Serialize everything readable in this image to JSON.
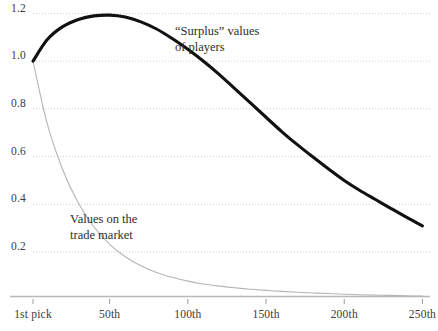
{
  "chart_data": {
    "type": "line",
    "title": "",
    "xlabel": "",
    "ylabel": "",
    "grid": true,
    "legend_position": "inline-annotations",
    "xlim": [
      1,
      256
    ],
    "ylim": [
      0,
      1.26
    ],
    "x_tick_labels": [
      "1st pick",
      "50th",
      "100th",
      "150th",
      "200th",
      "250th"
    ],
    "x_tick_values": [
      1,
      50,
      100,
      150,
      200,
      250
    ],
    "y_tick_labels": [
      "1.2",
      "1.0",
      "0.8",
      "0.6",
      "0.4",
      "0.2"
    ],
    "y_tick_values": [
      1.2,
      1.0,
      0.8,
      0.6,
      0.4,
      0.2
    ],
    "x": [
      1,
      10,
      20,
      30,
      40,
      50,
      60,
      70,
      80,
      90,
      100,
      110,
      120,
      130,
      140,
      150,
      160,
      170,
      180,
      190,
      200,
      210,
      220,
      230,
      240,
      250
    ],
    "series": [
      {
        "name": "\"Surplus\" values of players",
        "color": "#111111",
        "width": 3.1,
        "values": [
          1.0,
          1.09,
          1.145,
          1.175,
          1.19,
          1.193,
          1.185,
          1.165,
          1.135,
          1.095,
          1.05,
          1.0,
          0.945,
          0.885,
          0.825,
          0.765,
          0.705,
          0.65,
          0.598,
          0.548,
          0.5,
          0.458,
          0.42,
          0.382,
          0.345,
          0.31
        ]
      },
      {
        "name": "Values on the trade market",
        "color": "#b4b4b4",
        "width": 1.1,
        "values": [
          1.0,
          0.74,
          0.545,
          0.405,
          0.305,
          0.232,
          0.18,
          0.142,
          0.114,
          0.094,
          0.078,
          0.066,
          0.057,
          0.05,
          0.044,
          0.039,
          0.035,
          0.031,
          0.028,
          0.026,
          0.023,
          0.021,
          0.019,
          0.018,
          0.016,
          0.015
        ]
      }
    ],
    "annotations": [
      {
        "name": "surplus-annotation",
        "text": "“Surplus” values\nof players",
        "left": 175,
        "top": 24
      },
      {
        "name": "trade-market-annotation",
        "text": "Values on the\ntrade market",
        "left": 70,
        "top": 212
      }
    ],
    "colors": {
      "surplus_line": "#111111",
      "trade_line": "#b4b4b4",
      "gridline": "#c9c9c9",
      "axis": "#b9b9b9",
      "label_text": "#3b3b3b",
      "annotation_text": "#2e2e2e",
      "background": "#ffffff"
    }
  }
}
